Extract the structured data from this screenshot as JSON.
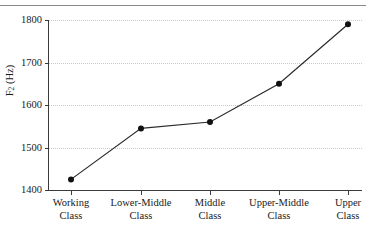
{
  "chart_data": {
    "type": "line",
    "title": "",
    "subtitle": "",
    "xlabel": "",
    "ylabel": "F2 (Hz)",
    "ylabel_base": "F",
    "ylabel_sub": "2",
    "ylabel_unit": " (Hz)",
    "categories": [
      "Working Class",
      "Lower-Middle Class",
      "Middle Class",
      "Upper-Middle Class",
      "Upper Class"
    ],
    "category_lines": [
      [
        "Working",
        "Class"
      ],
      [
        "Lower-Middle",
        "Class"
      ],
      [
        "Middle",
        "Class"
      ],
      [
        "Upper-Middle",
        "Class"
      ],
      [
        "Upper",
        "Class"
      ]
    ],
    "values": [
      1425,
      1545,
      1560,
      1650,
      1790
    ],
    "ylim": [
      1400,
      1800
    ],
    "yticks": [
      1800,
      1700,
      1600,
      1500,
      1400
    ],
    "ytick_labels": [
      "1800",
      "1700",
      "1600",
      "1500",
      "1400"
    ],
    "grid": true,
    "grid_axis": "y",
    "legend": "none",
    "marker": "filled-circle",
    "line_color": "#2b2b2b",
    "marker_color": "#111111",
    "grid_color": "#c9c9c9",
    "axis_color": "#3a3a3a",
    "background_color": "#ffffff"
  }
}
